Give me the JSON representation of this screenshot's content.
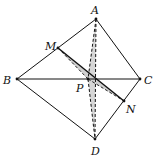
{
  "diagram": {
    "type": "tetrahedron",
    "points": {
      "A": {
        "label": "A",
        "x": 96,
        "y": 19
      },
      "B": {
        "label": "B",
        "x": 17,
        "y": 79
      },
      "C": {
        "label": "C",
        "x": 140,
        "y": 79
      },
      "D": {
        "label": "D",
        "x": 95,
        "y": 139
      },
      "M": {
        "label": "M",
        "x": 58,
        "y": 48
      },
      "N": {
        "label": "N",
        "x": 124,
        "y": 101
      },
      "P": {
        "label": "P",
        "x": 88,
        "y": 79
      }
    },
    "solid_edges": [
      "AB",
      "AC",
      "BC",
      "BD",
      "CD",
      "MN"
    ],
    "dashed_edges": [
      "AD",
      "AP",
      "PD",
      "MP",
      "PN"
    ],
    "shaded_regions": [
      "APD",
      "MPN"
    ],
    "colors": {
      "line": "#111111",
      "shade": "#d0d0d0"
    }
  }
}
